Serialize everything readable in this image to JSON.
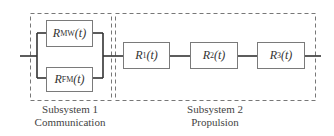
{
  "subsystem1": {
    "title": "Subsystem 1",
    "name": "Communication",
    "blocks": [
      {
        "sym": "R",
        "sub": "MW",
        "arg": "(t)"
      },
      {
        "sym": "R",
        "sub": "FM",
        "arg": "(t)"
      }
    ],
    "arrangement": "parallel"
  },
  "subsystem2": {
    "title": "Subsystem 2",
    "name": "Propulsion",
    "blocks": [
      {
        "sym": "R",
        "sub": "1",
        "arg": "(t)"
      },
      {
        "sym": "R",
        "sub": "2",
        "arg": "(t)"
      },
      {
        "sym": "R",
        "sub": "3",
        "arg": "(t)"
      }
    ],
    "arrangement": "series"
  },
  "colors": {
    "line": "#333333",
    "dash": "#777777",
    "box": "#7a7a7a"
  }
}
